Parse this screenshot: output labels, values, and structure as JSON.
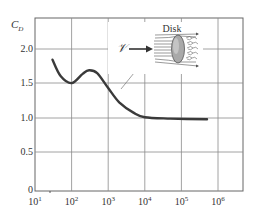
{
  "chart_data": {
    "type": "line",
    "title": "",
    "xlabel": "",
    "ylabel": "C_D",
    "x_scale": "log",
    "xlim": [
      10,
      4800000
    ],
    "ylim": [
      0,
      2.45
    ],
    "grid": true,
    "x_ticks": [
      "10^1",
      "10^2",
      "10^3",
      "10^4",
      "10^5",
      "10^6"
    ],
    "y_ticks": [
      "0",
      "0.5",
      "1.0",
      "1.5",
      "2.0"
    ],
    "series": [
      {
        "name": "Disk drag coefficient",
        "x": [
          30,
          50,
          100,
          200,
          300,
          500,
          1000,
          2000,
          5000,
          10000,
          50000,
          500000
        ],
        "values": [
          1.85,
          1.62,
          1.52,
          1.65,
          1.7,
          1.66,
          1.45,
          1.25,
          1.1,
          1.04,
          1.02,
          1.01
        ]
      }
    ],
    "annotations": [
      {
        "text": "Disk",
        "type": "inset-illustration",
        "description": "flow approaching disk with velocity arrow and wake eddies"
      },
      {
        "text": "𝒱",
        "type": "velocity-arrow-label"
      }
    ]
  },
  "labels": {
    "y_axis": "C",
    "y_axis_sub": "D",
    "y_ticks": [
      "2.0",
      "1.5",
      "1.0",
      "0.5",
      "0"
    ],
    "x_ticks_base": [
      "10",
      "10",
      "10",
      "10",
      "10",
      "10"
    ],
    "x_ticks_exp": [
      "1",
      "2",
      "3",
      "4",
      "5",
      "6"
    ],
    "inset_title": "Disk",
    "velocity_symbol": "𝒱"
  },
  "colors": {
    "curve": "#3a3a3a",
    "grid": "#8a8a8a",
    "axis": "#555555",
    "disk_fill": "#a9a9a9"
  }
}
